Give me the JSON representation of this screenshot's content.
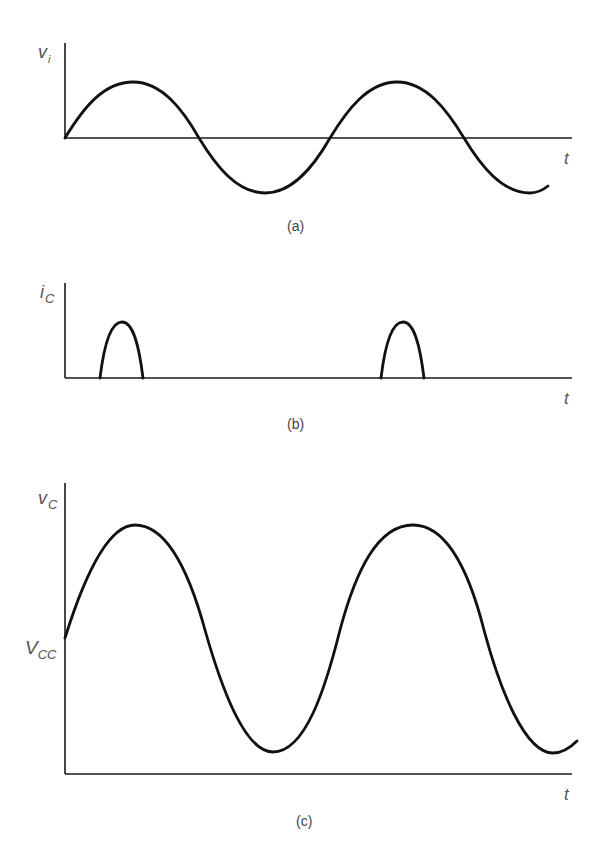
{
  "figure": {
    "colors": {
      "background": "#ffffff",
      "waveform": "#111111",
      "axis": "#1a1a1a",
      "label": "#555555"
    },
    "panels": [
      {
        "id": "a",
        "caption": "(a)",
        "y_label_main": "v",
        "y_label_sub": "i",
        "x_label": "t",
        "description": "Input voltage sinusoid v_i starting at zero"
      },
      {
        "id": "b",
        "caption": "(b)",
        "y_label_main": "i",
        "y_label_sub": "C",
        "x_label": "t",
        "description": "Collector current i_C as narrow pulses near input peaks (class C conduction)"
      },
      {
        "id": "c",
        "caption": "(c)",
        "y_label_main": "v",
        "y_label_sub": "C",
        "x_label": "t",
        "level_label_main": "V",
        "level_label_sub": "CC",
        "description": "Collector voltage v_C oscillating about V_CC"
      }
    ]
  }
}
